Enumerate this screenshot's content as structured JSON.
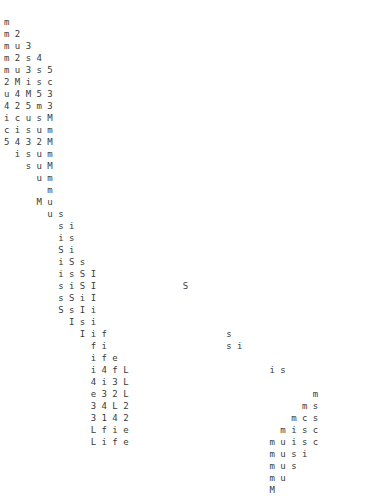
{
  "document": {
    "kind": "ascii-art-text-grid",
    "char_count_columns": 30,
    "row_count": 38,
    "font_size_px": 9,
    "line_height_px": 12,
    "char_width_px": 11.6,
    "text_color": "#3a3a3a",
    "background_color": "#ffffff",
    "origin_x_px": 4,
    "origin_y_px": 16
  },
  "grid": {
    "rows": [
      "m",
      "m 2",
      "m u 3",
      "m 2 s 4",
      "m u 3 s 5",
      "2 M i s c",
      "u 4 M 5 3",
      "4 2 5 m 3",
      "i c u s M",
      "c i s u m",
      "5 4 3 2 M",
      "  i s u m",
      "    s u M",
      "      u m",
      "        m",
      "      M u",
      "        u s",
      "          s i",
      "          i s",
      "          S i",
      "          i S s",
      "          i s S I",
      "          s i S I                S",
      "          s S i I",
      "          S s I i",
      "            I s i",
      "              I i f                      s",
      "                f i                      s i",
      "                i f e",
      "                i 4 f L                          i s",
      "                4 i 3 L",
      "                e 3 2 L                                  m",
      "                3 4 L 2                                m s",
      "                3 1 4 2                              m c s",
      "                L f i e                            m i s c",
      "                L i f e                          m u i s c",
      "                                                 m u s i",
      "                                                 m u s",
      "                                                 m u",
      "                                                 M"
    ]
  },
  "legend": {
    "title": "Character grid",
    "description": "Monospace staircase of letters and digits descending left-to-right."
  }
}
